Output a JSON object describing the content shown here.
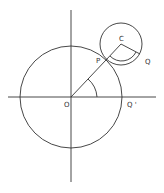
{
  "diagram": {
    "labels": {
      "origin": "O",
      "point_p": "P",
      "center_c": "C",
      "point_q": "Q",
      "point_q_prime": "Q '"
    },
    "colors": {
      "stroke": "#333333",
      "background": "#ffffff"
    }
  }
}
